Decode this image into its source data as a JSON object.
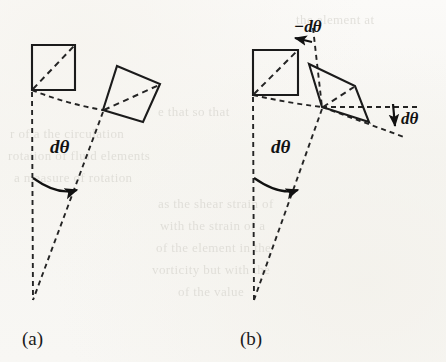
{
  "figure": {
    "background_color": "#f7f6f3",
    "ink_color": "#1b1b1b",
    "panels": [
      {
        "id": "a",
        "label": "(a)",
        "caption_note": "rigid-body rotation: element rotates by d-theta without distortion",
        "shapes": [
          {
            "name": "undeformed-square",
            "kind": "square",
            "style": "solid",
            "vertices": [
              [
                32,
                45
              ],
              [
                75,
                45
              ],
              [
                75,
                90
              ],
              [
                32,
                90
              ]
            ]
          },
          {
            "name": "rotated-square",
            "kind": "square",
            "style": "solid",
            "vertices": [
              [
                117,
                66
              ],
              [
                160,
                84
              ],
              [
                143,
                122
              ],
              [
                103,
                110
              ]
            ]
          }
        ],
        "diagonals": [
          {
            "name": "undeformed-square-diagonal",
            "from": [
              32,
              90
            ],
            "to": [
              75,
              45
            ]
          },
          {
            "name": "rotated-square-diagonal",
            "from": [
              103,
              110
            ],
            "to": [
              160,
              84
            ]
          }
        ],
        "radii": [
          {
            "name": "reference-radius-vertical",
            "from": [
              32,
              90
            ],
            "to": [
              33,
              300
            ]
          },
          {
            "name": "rotated-radius",
            "from": [
              103,
              110
            ],
            "to": [
              33,
              300
            ]
          }
        ],
        "connector": {
          "name": "arc-connector",
          "from": [
            32,
            90
          ],
          "to": [
            103,
            110
          ]
        },
        "angle_arcs": [
          {
            "name": "d-theta-arc",
            "label": "dθ",
            "label_pos": [
              50,
              152
            ],
            "arc_start": [
              33,
              180
            ],
            "arc_end": [
              80,
              190
            ],
            "arrow_dir": "clockwise"
          }
        ]
      },
      {
        "id": "b",
        "label": "(b)",
        "caption_note": "shear deformation: element distorts, diagonals rotate by plus and minus d-theta",
        "shapes": [
          {
            "name": "undeformed-square",
            "kind": "square",
            "style": "solid",
            "vertices": [
              [
                253,
                50
              ],
              [
                298,
                50
              ],
              [
                298,
                95
              ],
              [
                253,
                95
              ]
            ]
          },
          {
            "name": "sheared-parallelogram",
            "kind": "parallelogram",
            "style": "solid",
            "vertices": [
              [
                309,
                64
              ],
              [
                355,
                86
              ],
              [
                369,
                122
              ],
              [
                322,
                107
              ]
            ]
          }
        ],
        "diagonals": [
          {
            "name": "undeformed-square-diagonal",
            "from": [
              253,
              95
            ],
            "to": [
              298,
              50
            ]
          },
          {
            "name": "parallelogram-diagonal",
            "from": [
              322,
              107
            ],
            "to": [
              355,
              86
            ]
          }
        ],
        "radii": [
          {
            "name": "reference-radius-vertical",
            "from": [
              253,
              95
            ],
            "to": [
              254,
              300
            ]
          },
          {
            "name": "rotated-radius",
            "from": [
              322,
              107
            ],
            "to": [
              254,
              300
            ]
          }
        ],
        "connector": {
          "name": "arc-connector",
          "from": [
            253,
            95
          ],
          "to": [
            322,
            107
          ]
        },
        "reference_guides": [
          {
            "name": "vertical-guide-dashed",
            "from": [
              311,
              30
            ],
            "to": [
              322,
              107
            ]
          },
          {
            "name": "horizontal-guide-dashed",
            "from": [
              322,
              107
            ],
            "to": [
              418,
              107
            ]
          },
          {
            "name": "lower-guide-dashed",
            "from": [
              322,
              107
            ],
            "to": [
              403,
              135
            ]
          }
        ],
        "angle_arcs": [
          {
            "name": "d-theta-arc",
            "label": "dθ",
            "label_pos": [
              272,
              152
            ],
            "arc_start": [
              254,
              180
            ],
            "arc_end": [
              300,
              190
            ],
            "arrow_dir": "clockwise"
          }
        ],
        "angle_labels": [
          {
            "name": "minus-d-theta-label",
            "label": "−dθ",
            "pos": [
              300,
              31
            ],
            "arrow": "left"
          },
          {
            "name": "d-theta-right-label",
            "label": "dθ",
            "pos": [
              406,
              122
            ],
            "arrow": "down"
          }
        ]
      }
    ],
    "labels": {
      "d_theta": "dθ",
      "minus_d_theta": "−dθ",
      "panel_a": "(a)",
      "panel_b": "(b)"
    },
    "panel_label_positions": {
      "a": [
        22,
        345
      ],
      "b": [
        240,
        345
      ]
    },
    "ghost_text": [
      {
        "text": "the element at",
        "x": 296,
        "y": 12
      },
      {
        "text": "e that   so that",
        "x": 158,
        "y": 104
      },
      {
        "text": "r of a   the circulation",
        "x": 10,
        "y": 126
      },
      {
        "text": "rotation of fluid elements",
        "x": 8,
        "y": 148
      },
      {
        "text": "a measure of  rotation",
        "x": 14,
        "y": 170
      },
      {
        "text": "as the shear strain of",
        "x": 158,
        "y": 196
      },
      {
        "text": "with the strain of a",
        "x": 160,
        "y": 218
      },
      {
        "text": "of the element in the",
        "x": 156,
        "y": 240
      },
      {
        "text": "vorticity   but   with the",
        "x": 152,
        "y": 262
      },
      {
        "text": "of  the   value",
        "x": 178,
        "y": 284
      }
    ]
  }
}
